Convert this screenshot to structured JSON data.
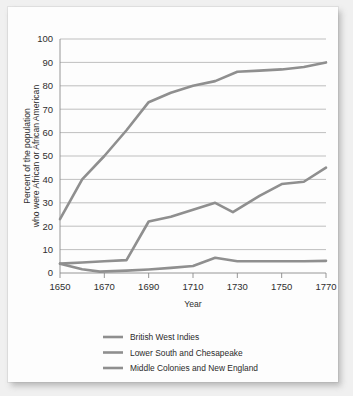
{
  "chart_data": {
    "type": "line",
    "title": "",
    "xlabel": "Year",
    "ylabel": "Percent of the population who were African or African American",
    "ylabel_line1": "Percent of the population",
    "ylabel_line2": "who were African or African American",
    "xlim": [
      1650,
      1770
    ],
    "ylim": [
      0,
      100
    ],
    "xticks": [
      1650,
      1670,
      1690,
      1710,
      1730,
      1750,
      1770
    ],
    "xtick_labels": [
      "1650",
      "1670",
      "1690",
      "1710",
      "1730",
      "1750",
      "1770"
    ],
    "yticks": [
      0,
      10,
      20,
      30,
      40,
      50,
      60,
      70,
      80,
      90,
      100
    ],
    "ytick_labels": [
      "0",
      "10",
      "20",
      "30",
      "40",
      "50",
      "60",
      "70",
      "80",
      "90",
      "100"
    ],
    "grid": true,
    "grid_axis": "y",
    "legend_position": "below",
    "line_color": "#8f8f8f",
    "series": [
      {
        "name": "British West Indies",
        "color": "#8f8f8f",
        "x": [
          1650,
          1660,
          1670,
          1680,
          1690,
          1700,
          1710,
          1720,
          1730,
          1740,
          1750,
          1760,
          1770
        ],
        "values": [
          23,
          40,
          50,
          61,
          73,
          77,
          80,
          82,
          86,
          86.5,
          87,
          88,
          90
        ]
      },
      {
        "name": "Lower South and Chesapeake",
        "color": "#8f8f8f",
        "x": [
          1650,
          1660,
          1670,
          1680,
          1690,
          1700,
          1710,
          1720,
          1728,
          1740,
          1750,
          1760,
          1770
        ],
        "values": [
          4,
          4.5,
          5,
          5.5,
          22,
          24,
          27,
          30,
          26,
          33,
          38,
          39,
          45
        ]
      },
      {
        "name": "Middle Colonies and New England",
        "color": "#8f8f8f",
        "x": [
          1650,
          1660,
          1668,
          1680,
          1690,
          1700,
          1710,
          1720,
          1730,
          1740,
          1750,
          1760,
          1770
        ],
        "values": [
          4,
          1.6,
          0.6,
          1,
          1.5,
          2.2,
          3,
          6.5,
          5,
          5,
          5,
          5,
          5.2
        ]
      }
    ]
  },
  "legend": {
    "items": [
      {
        "label": "British West Indies"
      },
      {
        "label": "Lower South and Chesapeake"
      },
      {
        "label": "Middle Colonies and New England"
      }
    ]
  }
}
